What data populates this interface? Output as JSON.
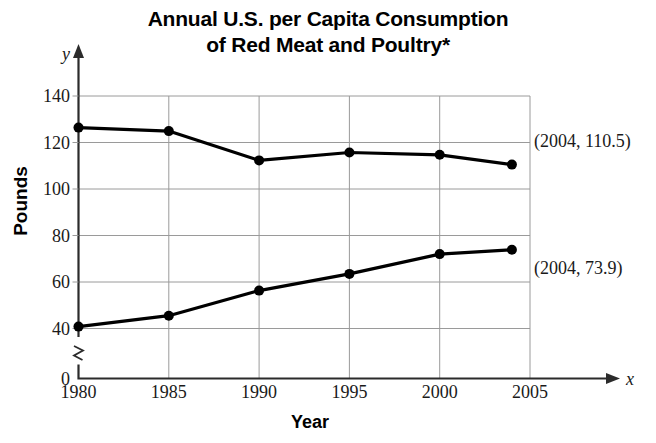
{
  "chart_data": {
    "type": "line",
    "title": "Annual U.S. per Capita Consumption of Red Meat and Poultry*",
    "title_lines": [
      "Annual U.S. per Capita Consumption",
      "of Red Meat and Poultry*"
    ],
    "xlabel": "Year",
    "ylabel": "Pounds",
    "x_axis_variable": "x",
    "y_axis_variable": "y",
    "x": [
      1980,
      1985,
      1990,
      1995,
      2000,
      2004
    ],
    "xlim": [
      1980,
      2005
    ],
    "ylim": [
      40,
      140
    ],
    "y_break_below": 40,
    "y_zero_label": "0",
    "xticks": [
      1980,
      1985,
      1990,
      1995,
      2000,
      2005
    ],
    "xticklabels": [
      "1980",
      "1985",
      "1990",
      "1995",
      "2000",
      "2005"
    ],
    "yticks": [
      40,
      60,
      80,
      100,
      120,
      140
    ],
    "yticklabels": [
      "40",
      "60",
      "80",
      "100",
      "120",
      "140"
    ],
    "grid": true,
    "legend": "none",
    "series": [
      {
        "name": "Red Meat",
        "values": [
          126.4,
          124.9,
          112.3,
          115.7,
          114.7,
          110.5
        ]
      },
      {
        "name": "Poultry",
        "values": [
          40.8,
          45.5,
          56.3,
          63.5,
          72.0,
          73.9
        ]
      }
    ],
    "annotations": [
      {
        "text": "(2004, 110.5)",
        "x": 2004,
        "y": 110.5,
        "series": "Red Meat"
      },
      {
        "text": "(2004, 73.9)",
        "x": 2004,
        "y": 73.9,
        "series": "Poultry"
      }
    ]
  }
}
